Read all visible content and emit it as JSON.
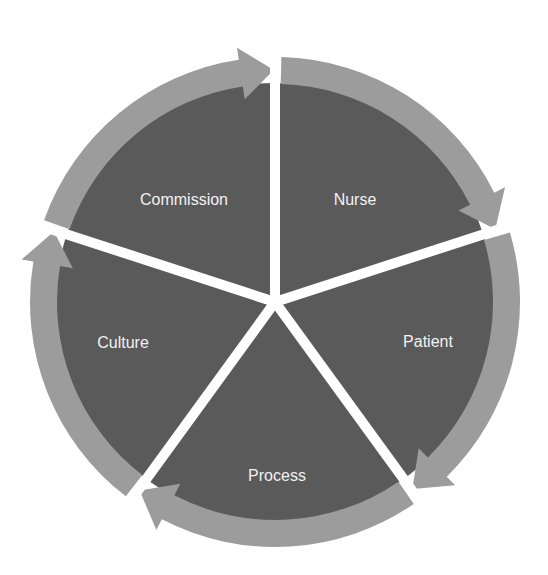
{
  "diagram": {
    "type": "cycle",
    "center": [
      275,
      302
    ],
    "outer_radius": 245,
    "inner_radius": 219,
    "colors": {
      "segment_fill": "#5a5a5a",
      "ring_fill": "#9c9c9c",
      "spoke": "#ffffff",
      "label": "#f2f2f2",
      "background": "#ffffff"
    },
    "segments": [
      {
        "label": "Nurse",
        "start_angle": -90,
        "end_angle": -18,
        "label_pos": [
          355,
          205
        ]
      },
      {
        "label": "Patient",
        "start_angle": -18,
        "end_angle": 54,
        "label_pos": [
          428,
          347
        ]
      },
      {
        "label": "Process",
        "start_angle": 54,
        "end_angle": 126,
        "label_pos": [
          277,
          481
        ]
      },
      {
        "label": "Culture",
        "start_angle": 126,
        "end_angle": 198,
        "label_pos": [
          123,
          348
        ]
      },
      {
        "label": "Commission",
        "start_angle": 198,
        "end_angle": 270,
        "label_pos": [
          184,
          205
        ]
      }
    ],
    "flow_direction": "clockwise"
  }
}
